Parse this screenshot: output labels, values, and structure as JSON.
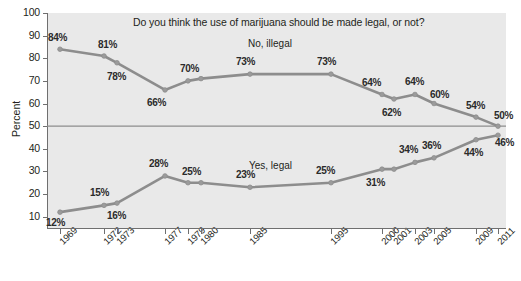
{
  "chart_data": {
    "type": "line",
    "title": "Do you think the use of marijuana should be made legal, or not?",
    "xlabel": "",
    "ylabel": "Percent",
    "ylim": [
      5,
      100
    ],
    "yticks": [
      10,
      20,
      30,
      40,
      50,
      60,
      70,
      80,
      90,
      100
    ],
    "grid": false,
    "legend_position": "inline-annotation",
    "reference_line": 50,
    "categories": [
      "1969",
      "1972",
      "1973",
      "1977",
      "1979",
      "1980",
      "1985",
      "1995",
      "2000",
      "2001",
      "2003",
      "2005",
      "2009",
      "2011"
    ],
    "series": [
      {
        "name": "No, illegal",
        "values": [
          84,
          81,
          78,
          66,
          70,
          71,
          73,
          73,
          64,
          62,
          64,
          60,
          54,
          50
        ],
        "point_labels": [
          "84%",
          "81%",
          "78%",
          "66%",
          "70%",
          "",
          "73%",
          "73%",
          "64%",
          "62%",
          "64%",
          "60%",
          "54%",
          "50%"
        ]
      },
      {
        "name": "Yes, legal",
        "values": [
          12,
          15,
          16,
          28,
          25,
          25,
          23,
          25,
          31,
          31,
          34,
          36,
          44,
          46
        ],
        "point_labels": [
          "12%",
          "15%",
          "16%",
          "28%",
          "25%",
          "",
          "23%",
          "25%",
          "31%",
          "",
          "34%",
          "36%",
          "44%",
          "46%"
        ]
      }
    ],
    "colors": {
      "line": "#8d8d8d",
      "plot_background": "#e9e9e9",
      "reference_line": "#8d8d8d",
      "text": "#231f20"
    }
  },
  "labels": {
    "series_no": "No, illegal",
    "series_yes": "Yes, legal"
  }
}
